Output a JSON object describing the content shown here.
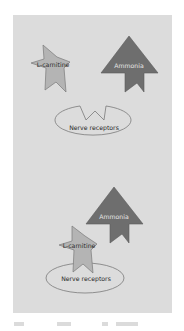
{
  "colors": {
    "panel_bg": "#dcdcdc",
    "lcarnitine_fill": "#b4b4b4",
    "ammonia_fill": "#6e6e6e",
    "receptor_fill": "#dcdcdc",
    "outline": "#7a7a7a",
    "dark_text": "#2a2a2a",
    "light_text": "#e6e6e6"
  },
  "diagram": {
    "top": {
      "lcarnitine_label": "L-carnitine",
      "ammonia_label": "Ammonia",
      "receptor_label": "Nerve receptors"
    },
    "bottom": {
      "lcarnitine_label": "L-carnitine",
      "ammonia_label": "Ammonia",
      "receptor_label": "Nerve receptors"
    }
  }
}
